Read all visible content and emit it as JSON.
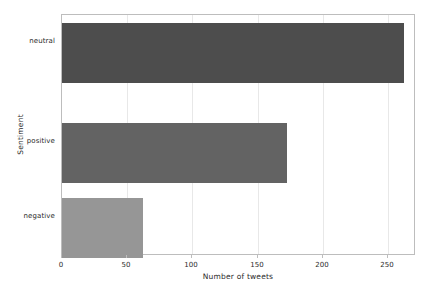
{
  "chart_data": {
    "type": "bar",
    "orientation": "horizontal",
    "title": "",
    "xlabel": "Number of tweets",
    "ylabel": "Sentiment",
    "categories": [
      "negative",
      "positive",
      "neutral"
    ],
    "values": [
      62,
      172,
      262
    ],
    "series": [
      {
        "name": "Number of tweets",
        "values": [
          62,
          172,
          262
        ]
      }
    ],
    "bars": [
      {
        "category": "neutral",
        "value": 262,
        "color": "#4d4d4d"
      },
      {
        "category": "positive",
        "value": 172,
        "color": "#636363"
      },
      {
        "category": "negative",
        "value": 62,
        "color": "#969696"
      }
    ],
    "xlim": [
      0,
      271
    ],
    "xticks": [
      0,
      50,
      100,
      150,
      200,
      250
    ],
    "xtick_labels": [
      "0",
      "50",
      "100",
      "150",
      "200",
      "250"
    ],
    "ytick_labels": [
      "neutral",
      "positive",
      "negative"
    ],
    "grid": "vertical",
    "grid_color": "#e8e8e8",
    "legend": "none",
    "frame_color": "#bdbdbd",
    "background": "#ffffff"
  }
}
